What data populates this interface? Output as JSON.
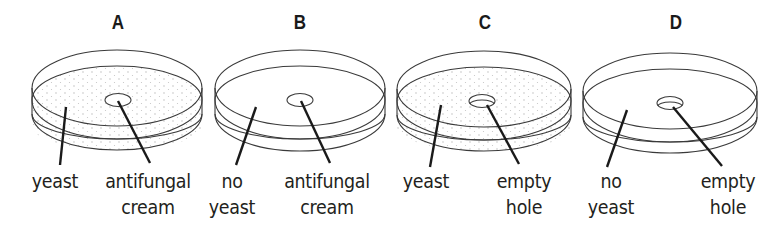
{
  "diagram": {
    "colors": {
      "line": "#3a3a3a",
      "pointer": "#1a1a1a",
      "yeast_dots": "#b8b8b8",
      "background": "#ffffff"
    },
    "dishes": [
      {
        "id": "A",
        "heading": "A",
        "yeast": true,
        "hole": "antifungal cream",
        "labels": [
          {
            "lines": [
              "yeast"
            ],
            "x": 55,
            "y": 169
          },
          {
            "lines": [
              "antifungal",
              "cream"
            ],
            "x": 148,
            "y": 169
          }
        ]
      },
      {
        "id": "B",
        "heading": "B",
        "yeast": false,
        "hole": "antifungal cream",
        "labels": [
          {
            "lines": [
              "no",
              "yeast"
            ],
            "x": 232,
            "y": 169
          },
          {
            "lines": [
              "antifungal",
              "cream"
            ],
            "x": 327,
            "y": 169
          }
        ]
      },
      {
        "id": "C",
        "heading": "C",
        "yeast": true,
        "hole": "empty hole",
        "labels": [
          {
            "lines": [
              "yeast"
            ],
            "x": 426,
            "y": 169
          },
          {
            "lines": [
              "empty",
              "hole"
            ],
            "x": 524,
            "y": 169
          }
        ]
      },
      {
        "id": "D",
        "heading": "D",
        "yeast": false,
        "hole": "empty hole",
        "labels": [
          {
            "lines": [
              "no",
              "yeast"
            ],
            "x": 611,
            "y": 169
          },
          {
            "lines": [
              "empty",
              "hole"
            ],
            "x": 728,
            "y": 169
          }
        ]
      }
    ]
  },
  "headings": {
    "a": "A",
    "b": "B",
    "c": "C",
    "d": "D"
  },
  "labels": {
    "a_left": "yeast",
    "a_right_1": "antifungal",
    "a_right_2": "cream",
    "b_left_1": "no",
    "b_left_2": "yeast",
    "b_right_1": "antifungal",
    "b_right_2": "cream",
    "c_left": "yeast",
    "c_right_1": "empty",
    "c_right_2": "hole",
    "d_left_1": "no",
    "d_left_2": "yeast",
    "d_right_1": "empty",
    "d_right_2": "hole"
  }
}
